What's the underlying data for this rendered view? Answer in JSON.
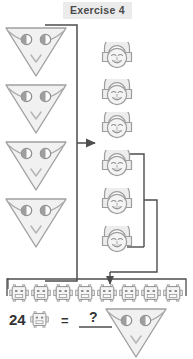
{
  "page": {
    "title": "Exercise 4",
    "background_color": "#ffffff",
    "title_badge_color": "#ebebeb",
    "line_color": "#4d4d4d",
    "shape_fill": "#f2f2f2",
    "shape_stroke": "#9a9a9a"
  },
  "left_column": {
    "name": "triangle-alien-column",
    "count": 4,
    "icon": "triangle-alien-icon",
    "items": [
      {
        "label": "triangle-alien-1"
      },
      {
        "label": "triangle-alien-2"
      },
      {
        "label": "triangle-alien-3"
      },
      {
        "label": "triangle-alien-4"
      }
    ]
  },
  "middle_column": {
    "name": "round-face-column",
    "count": 6,
    "icon": "round-face-icon",
    "items": [
      {
        "label": "round-face-1"
      },
      {
        "label": "round-face-2"
      },
      {
        "label": "round-face-3"
      },
      {
        "label": "round-face-4"
      },
      {
        "label": "round-face-5"
      },
      {
        "label": "round-face-6"
      }
    ],
    "grouped_from_index": 3,
    "grouped_count": 3
  },
  "robot_row": {
    "name": "robot-row",
    "count": 8,
    "icon": "robot-icon",
    "items": [
      {
        "label": "robot-1"
      },
      {
        "label": "robot-2"
      },
      {
        "label": "robot-3"
      },
      {
        "label": "robot-4"
      },
      {
        "label": "robot-5"
      },
      {
        "label": "robot-6"
      },
      {
        "label": "robot-7"
      },
      {
        "label": "robot-8"
      }
    ]
  },
  "equation": {
    "number": "24",
    "left_icon": "robot-icon",
    "equals": "=",
    "answer_placeholder": "?",
    "right_icon": "triangle-alien-icon"
  },
  "connectors": [
    {
      "name": "bracket-triangles-to-faces",
      "type": "bracket-right-arrow"
    },
    {
      "name": "bracket-faces-to-robots",
      "type": "bracket-right-down-arrow"
    },
    {
      "name": "bracket-triangles-to-robots",
      "type": "bracket-down"
    }
  ]
}
